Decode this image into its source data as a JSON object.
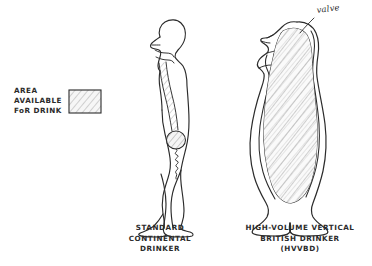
{
  "figure": {
    "kind": "hand-drawn-anatomical-cartoon",
    "background_color": "#ffffff",
    "ink_color": "#2b2b2b",
    "shading_color": "#b9b9b9",
    "width": 372,
    "height": 266
  },
  "legend": {
    "line1": "AREA",
    "line2": "AVAILABLE",
    "line3": "FoR DRINK",
    "swatch": {
      "name": "hatched-area-swatch",
      "fill": "#f2f2f2",
      "hatch_color": "#9a9a9a",
      "border_color": "#2b2b2b"
    }
  },
  "annotations": {
    "valve": "valve"
  },
  "subjects": [
    {
      "id": "standard-continental-drinker",
      "caption_line1": "STANDARD",
      "caption_line2": "CONTINENTAL",
      "caption_line3": "DRINKER",
      "stomach": "small-round-stomach",
      "esophagus": "narrow-tube",
      "posture": "upright-standing-profile"
    },
    {
      "id": "high-volume-vertical-british-drinker",
      "caption_line1": "HIGH-VOLUME VERTICAL",
      "caption_line2": "BRITISH DRINKER",
      "caption_line3": "(HVVBD)",
      "stomach": "full-torso-cavity",
      "esophagus": "wide-open-channel",
      "posture": "head-tipped-back-barrel-torso"
    }
  ]
}
